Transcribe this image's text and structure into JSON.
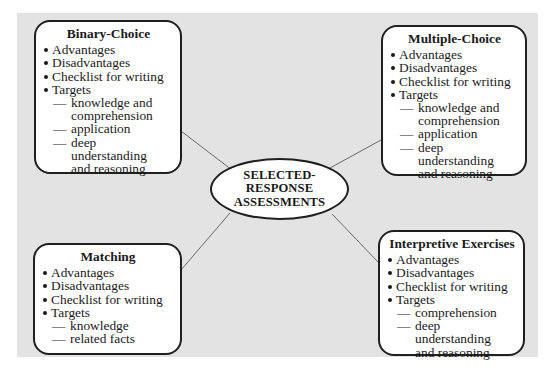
{
  "center": {
    "lines": [
      "SELECTED-",
      "RESPONSE",
      "ASSESSMENTS"
    ]
  },
  "boxes": {
    "binary_choice": {
      "title": "Binary-Choice",
      "items": [
        "Advantages",
        "Disadvantages",
        "Checklist for writing",
        "Targets"
      ],
      "targets": [
        {
          "line1": "knowledge and",
          "line2": "comprehension"
        },
        {
          "line1": "application",
          "line2": ""
        },
        {
          "line1": "deep understanding",
          "line2": "and reasoning"
        }
      ]
    },
    "multiple_choice": {
      "title": "Multiple-Choice",
      "items": [
        "Advantages",
        "Disadvantages",
        "Checklist for writing",
        "Targets"
      ],
      "targets": [
        {
          "line1": "knowledge and",
          "line2": "comprehension"
        },
        {
          "line1": "application",
          "line2": ""
        },
        {
          "line1": "deep understanding",
          "line2": "and reasoning"
        }
      ]
    },
    "matching": {
      "title": "Matching",
      "items": [
        "Advantages",
        "Disadvantages",
        "Checklist for writing",
        "Targets"
      ],
      "targets": [
        {
          "line1": "knowledge",
          "line2": ""
        },
        {
          "line1": "related facts",
          "line2": ""
        }
      ]
    },
    "interpretive_exercises": {
      "title": "Interpretive Exercises",
      "items": [
        "Advantages",
        "Disadvantages",
        "Checklist for writing",
        "Targets"
      ],
      "targets": [
        {
          "line1": "comprehension",
          "line2": ""
        },
        {
          "line1": "deep understanding",
          "line2": "and reasoning"
        }
      ]
    }
  },
  "symbols": {
    "dash": "—"
  },
  "colors": {
    "panel_background": "#e3e3e3",
    "box_background": "#ffffff",
    "border": "#1f1f1f",
    "connector": "#6a6a6a"
  }
}
